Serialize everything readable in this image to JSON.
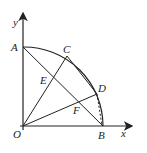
{
  "diagram": {
    "type": "geometry-quarter-circle",
    "axes": {
      "x_label": "x",
      "y_label": "y"
    },
    "points": {
      "O": {
        "label": "O",
        "x": 23,
        "y": 126
      },
      "A": {
        "label": "A",
        "x": 23,
        "y": 47
      },
      "B": {
        "label": "B",
        "x": 103,
        "y": 126
      },
      "C": {
        "label": "C",
        "x": 67,
        "y": 56
      },
      "D": {
        "label": "D",
        "x": 97,
        "y": 94
      },
      "E": {
        "label": "E",
        "x": 50,
        "y": 84
      },
      "F": {
        "label": "F",
        "x": 79,
        "y": 104
      }
    },
    "segments": [
      "AB",
      "OC",
      "OD",
      "CD"
    ],
    "dashed_segments": [
      "DB"
    ],
    "arc": "AB (center O)",
    "colors": {
      "stroke": "#222222",
      "background": "#ffffff"
    }
  }
}
